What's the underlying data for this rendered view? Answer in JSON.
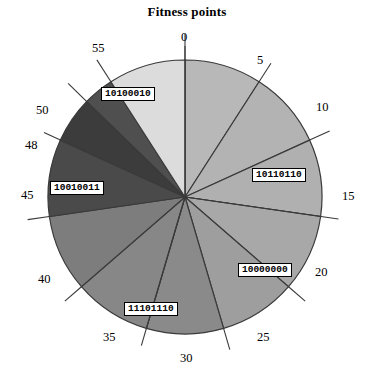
{
  "chart": {
    "title": "Fitness points"
  },
  "chart_data": {
    "type": "pie",
    "title": "Fitness points",
    "xlabel": "",
    "ylabel": "",
    "axis_units": "fitness points",
    "axis_total": 55,
    "grid": false,
    "legend": "none",
    "center": {
      "x": 185,
      "y": 197
    },
    "radius": 137,
    "tick_labels": [
      "0",
      "5",
      "10",
      "15",
      "20",
      "25",
      "30",
      "35",
      "40",
      "45",
      "48",
      "50",
      "55"
    ],
    "tick_values": [
      0,
      5,
      10,
      15,
      20,
      25,
      30,
      35,
      40,
      45,
      48,
      50,
      55
    ],
    "categories": [
      "0-5",
      "5-10",
      "10-15",
      "15-20",
      "20-25",
      "25-30",
      "30-35",
      "35-40",
      "40-45",
      "45-48",
      "48-50",
      "50-55"
    ],
    "values": [
      5,
      5,
      5,
      5,
      5,
      5,
      5,
      5,
      5,
      3,
      2,
      5
    ],
    "slices": [
      {
        "start": 0,
        "end": 5,
        "value": 5,
        "color": "#b8b8b8",
        "label": ""
      },
      {
        "start": 5,
        "end": 10,
        "value": 5,
        "color": "#b3b3b3",
        "label": ""
      },
      {
        "start": 10,
        "end": 15,
        "value": 5,
        "color": "#b0b0b0",
        "label": "10110110"
      },
      {
        "start": 15,
        "end": 20,
        "value": 5,
        "color": "#a8a8a8",
        "label": ""
      },
      {
        "start": 20,
        "end": 25,
        "value": 5,
        "color": "#9e9e9e",
        "label": "10000000"
      },
      {
        "start": 25,
        "end": 30,
        "value": 5,
        "color": "#8a8a8a",
        "label": ""
      },
      {
        "start": 30,
        "end": 35,
        "value": 5,
        "color": "#878787",
        "label": "11101110"
      },
      {
        "start": 35,
        "end": 40,
        "value": 5,
        "color": "#7d7d7d",
        "label": ""
      },
      {
        "start": 40,
        "end": 45,
        "value": 5,
        "color": "#4a4a4a",
        "label": ""
      },
      {
        "start": 45,
        "end": 48,
        "value": 3,
        "color": "#3c3c3c",
        "label": "10010011"
      },
      {
        "start": 48,
        "end": 50,
        "value": 2,
        "color": "#4f4f4f",
        "label": ""
      },
      {
        "start": 50,
        "end": 55,
        "value": 5,
        "color": "#dcdcdc",
        "label": "10100010"
      }
    ],
    "annotations": [
      {
        "text": "10100010",
        "slice": "50-55"
      },
      {
        "text": "10110110",
        "slice": "10-15"
      },
      {
        "text": "10000000",
        "slice": "20-25"
      },
      {
        "text": "11101110",
        "slice": "30-35"
      },
      {
        "text": "10010011",
        "slice": "45-48"
      }
    ]
  },
  "ticks": {
    "t0": "0",
    "t5": "5",
    "t10": "10",
    "t15": "15",
    "t20": "20",
    "t25": "25",
    "t30": "30",
    "t35": "35",
    "t40": "40",
    "t45": "45",
    "t48": "48",
    "t50": "50",
    "t55": "55"
  },
  "labels": {
    "l1": "10100010",
    "l2": "10110110",
    "l3": "10000000",
    "l4": "11101110",
    "l5": "10010011"
  },
  "colors": {
    "stroke": "#3a3a3a",
    "text": "#000000",
    "background": "#ffffff"
  }
}
